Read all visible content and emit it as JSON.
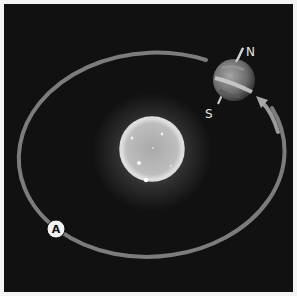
{
  "diagram": {
    "labels": {
      "north": "N",
      "south": "S",
      "marker": "A"
    },
    "colors": {
      "background": "#111111",
      "frame": "#f4f4f4",
      "orbit": "#7a7a7a",
      "sun": "#cfcfcf",
      "sun_glow": "#ffffff",
      "earth": "#8a8a8a",
      "text": "#e6e6e6"
    },
    "objects": [
      "sun",
      "earth",
      "orbit-path",
      "axis",
      "direction-arrow",
      "position-marker-A"
    ]
  }
}
